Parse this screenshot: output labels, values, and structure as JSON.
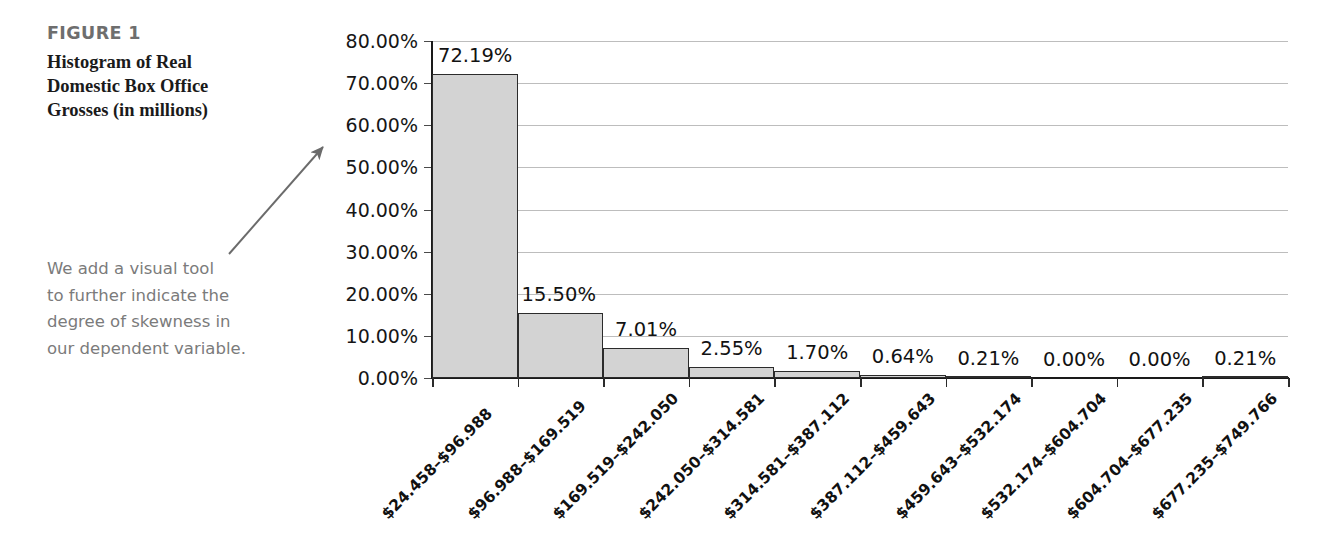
{
  "figure": {
    "label": "FIGURE 1",
    "title_lines": [
      "Histogram of Real",
      "Domestic Box Office",
      "Grosses (in millions)"
    ],
    "annotation_lines": [
      "We add a visual tool",
      "to further indicate the",
      "degree of skewness in",
      "our dependent variable."
    ],
    "label_color": "#6e6e6e",
    "title_color": "#1a1a1a",
    "annotation_color": "#7b7b7b",
    "arrow_color": "#6b6b6b"
  },
  "chart_data": {
    "type": "bar",
    "title": "Histogram of Real Domestic Box Office Grosses (in millions)",
    "xlabel": "",
    "ylabel": "",
    "grid": true,
    "legend": "none",
    "ylim": [
      0,
      80
    ],
    "ytick_labels": [
      "80.00%",
      "70.00%",
      "60.00%",
      "50.00%",
      "40.00%",
      "30.00%",
      "20.00%",
      "10.00%",
      "0.00%"
    ],
    "ytick_values": [
      80,
      70,
      60,
      50,
      40,
      30,
      20,
      10,
      0
    ],
    "categories": [
      "$24.458–$96.988",
      "$96.988–$169.519",
      "$169.519–$242.050",
      "$242.050–$314.581",
      "$314.581–$387.112",
      "$387.112–$459.643",
      "$459.643–$532.174",
      "$532.174–$604.704",
      "$604.704–$677.235",
      "$677.235–$749.766"
    ],
    "values": [
      72.19,
      15.5,
      7.01,
      2.55,
      1.7,
      0.64,
      0.21,
      0.0,
      0.0,
      0.21
    ],
    "data_labels": [
      "72.19%",
      "15.50%",
      "7.01%",
      "2.55%",
      "1.70%",
      "0.64%",
      "0.21%",
      "0.00%",
      "0.00%",
      "0.21%"
    ],
    "bar_fill": "#d3d3d3",
    "bar_border": "#2b2b2b",
    "gridline_color": "#bdbdbd",
    "axis_color": "#1a1a1a"
  }
}
